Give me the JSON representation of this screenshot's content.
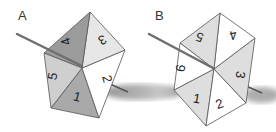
{
  "figure": {
    "panels": [
      {
        "label": "A",
        "shape": "pentagon",
        "faces": [
          {
            "number": "1",
            "fill": "#a9a9a9",
            "rotation": 15
          },
          {
            "number": "2",
            "fill": "#ffffff",
            "rotation": 75
          },
          {
            "number": "3",
            "fill": "#e6e6e6",
            "rotation": 150
          },
          {
            "number": "4",
            "fill": "#9b9b9b",
            "rotation": -100
          },
          {
            "number": "5",
            "fill": "#cfcfcf",
            "rotation": -80
          }
        ]
      },
      {
        "label": "B",
        "shape": "hexagon",
        "faces": [
          {
            "number": "1",
            "fill": "#dedede",
            "rotation": 10
          },
          {
            "number": "2",
            "fill": "#ffffff",
            "rotation": -20
          },
          {
            "number": "3",
            "fill": "#dedede",
            "rotation": 100
          },
          {
            "number": "4",
            "fill": "#ffffff",
            "rotation": 165
          },
          {
            "number": "5",
            "fill": "#dedede",
            "rotation": 200
          },
          {
            "number": "6",
            "fill": "#ffffff",
            "rotation": -80
          }
        ]
      }
    ],
    "colors": {
      "edge": "#555555",
      "axle": "#6e6e6e",
      "shadow": "#9a9a9a"
    }
  }
}
